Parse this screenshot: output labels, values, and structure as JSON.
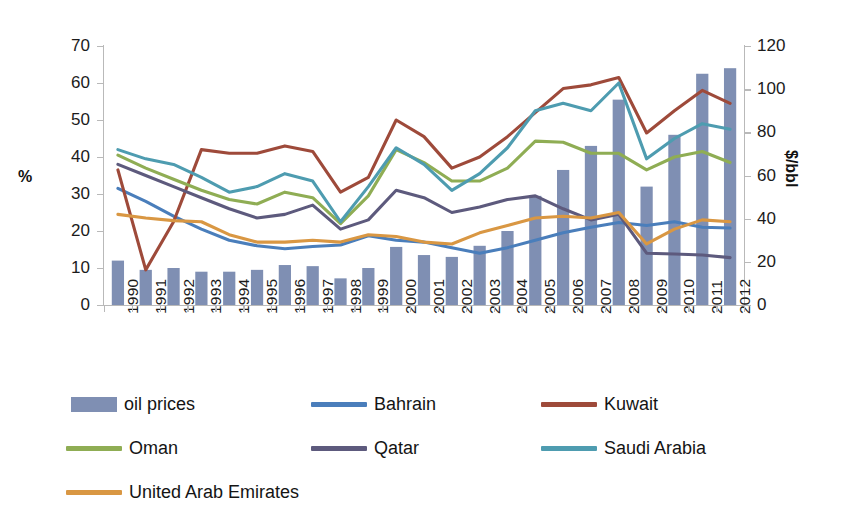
{
  "chart_data": {
    "type": "bar+line",
    "title": "",
    "xlabel": "",
    "ylabel": "%",
    "y2label": "$/bbl",
    "ylim": [
      0,
      70
    ],
    "y2lim": [
      0,
      120
    ],
    "ytick_step": 10,
    "y2tick_step": 20,
    "grid": false,
    "legend_position": "bottom",
    "categories": [
      "1990",
      "1991",
      "1992",
      "1993",
      "1994",
      "1995",
      "1996",
      "1997",
      "1998",
      "1999",
      "2000",
      "2001",
      "2002",
      "2003",
      "2004",
      "2005",
      "2006",
      "2007",
      "2008",
      "2009",
      "2010",
      "2011",
      "2012"
    ],
    "yticks": [
      "0",
      "10",
      "20",
      "30",
      "40",
      "50",
      "60",
      "70"
    ],
    "y2ticks": [
      "0",
      "20",
      "40",
      "60",
      "80",
      "100",
      "120"
    ],
    "bar_series": {
      "name": "oil prices",
      "axis": "right",
      "unit": "$/bbl",
      "color": "#7f8fb3",
      "values_percent_axis": [
        12.0,
        9.5,
        10.0,
        9.0,
        9.0,
        9.5,
        10.8,
        10.5,
        7.2,
        10.0,
        15.7,
        13.5,
        13.0,
        16.0,
        20.0,
        29.5,
        36.5,
        43.0,
        55.5,
        32.0,
        46.0,
        62.5,
        64.0
      ],
      "values_dollars_per_bbl": [
        20.6,
        16.3,
        17.1,
        15.4,
        15.4,
        16.3,
        18.5,
        18.0,
        12.3,
        17.1,
        26.9,
        23.1,
        22.3,
        27.4,
        34.3,
        50.6,
        62.6,
        73.7,
        95.1,
        54.9,
        78.9,
        107.1,
        109.7
      ]
    },
    "series": [
      {
        "name": "Bahrain",
        "color": "#4a7ebb",
        "axis": "left",
        "unit": "%",
        "values": [
          31.5,
          28.0,
          24.0,
          20.5,
          17.5,
          16.0,
          15.2,
          15.8,
          16.2,
          18.7,
          17.5,
          17.0,
          15.5,
          14.0,
          15.5,
          17.5,
          19.5,
          21.0,
          22.3,
          21.5,
          22.5,
          21.0,
          20.8
        ]
      },
      {
        "name": "Kuwait",
        "color": "#9e4a3a",
        "axis": "left",
        "unit": "%",
        "values": [
          36.5,
          9.5,
          22.5,
          42.0,
          41.0,
          41.0,
          43.0,
          41.5,
          30.5,
          34.5,
          50.0,
          45.5,
          37.0,
          40.0,
          45.5,
          52.0,
          58.5,
          59.5,
          61.5,
          46.5,
          52.5,
          58.0,
          54.5
        ]
      },
      {
        "name": "Oman",
        "color": "#8fad54",
        "axis": "left",
        "unit": "%",
        "values": [
          40.5,
          37.0,
          34.0,
          31.0,
          28.5,
          27.3,
          30.5,
          29.0,
          22.0,
          29.5,
          42.0,
          38.5,
          33.5,
          33.5,
          37.0,
          44.3,
          44.0,
          41.0,
          41.0,
          36.5,
          40.0,
          41.5,
          38.5
        ]
      },
      {
        "name": "Qatar",
        "color": "#5d5a7d",
        "axis": "left",
        "unit": "%",
        "values": [
          38.0,
          35.0,
          32.0,
          29.0,
          26.0,
          23.5,
          24.5,
          27.0,
          20.5,
          23.0,
          31.0,
          29.0,
          25.0,
          26.5,
          28.5,
          29.5,
          26.0,
          23.0,
          24.5,
          14.0,
          13.8,
          13.5,
          12.8
        ]
      },
      {
        "name": "Saudi Arabia",
        "color": "#4e9cb0",
        "axis": "left",
        "unit": "%",
        "values": [
          42.0,
          39.5,
          38.0,
          34.5,
          30.5,
          32.0,
          35.5,
          33.5,
          22.5,
          32.0,
          42.5,
          38.0,
          31.0,
          35.5,
          42.5,
          52.5,
          54.5,
          52.5,
          60.0,
          39.5,
          45.0,
          49.0,
          47.5
        ]
      },
      {
        "name": "United Arab Emirates",
        "color": "#d99743",
        "axis": "left",
        "unit": "%",
        "values": [
          24.5,
          23.5,
          22.8,
          22.5,
          19.0,
          17.0,
          17.0,
          17.5,
          17.0,
          19.0,
          18.5,
          17.0,
          16.5,
          19.5,
          21.5,
          23.5,
          24.0,
          23.5,
          25.0,
          16.5,
          20.5,
          23.0,
          22.5
        ]
      }
    ]
  },
  "axes": {
    "left_title": "%",
    "right_title": "$/bbl"
  },
  "legend": {
    "items": [
      {
        "label": "oil prices",
        "color": "#7f8fb3",
        "marker": "bar"
      },
      {
        "label": "Bahrain",
        "color": "#4a7ebb",
        "marker": "line"
      },
      {
        "label": "Kuwait",
        "color": "#9e4a3a",
        "marker": "line"
      },
      {
        "label": "Oman",
        "color": "#8fad54",
        "marker": "line"
      },
      {
        "label": "Qatar",
        "color": "#5d5a7d",
        "marker": "line"
      },
      {
        "label": "Saudi Arabia",
        "color": "#4e9cb0",
        "marker": "line"
      },
      {
        "label": "United Arab Emirates",
        "color": "#d99743",
        "marker": "line"
      }
    ]
  }
}
